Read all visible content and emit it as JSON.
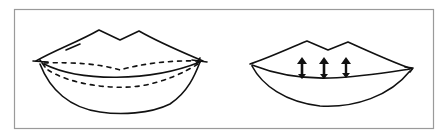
{
  "figure": {
    "type": "line-drawing",
    "panels": [
      {
        "id": "left",
        "subject": "lips",
        "annotations": [
          "dashed-upper-guide",
          "dashed-lower-guide"
        ]
      },
      {
        "id": "right",
        "subject": "lips",
        "annotations": [
          "up-arrow",
          "up-arrow",
          "up-arrow"
        ]
      }
    ],
    "colors": {
      "ink": "#111111",
      "frame": "#9a9a9a",
      "background": "#ffffff"
    }
  }
}
